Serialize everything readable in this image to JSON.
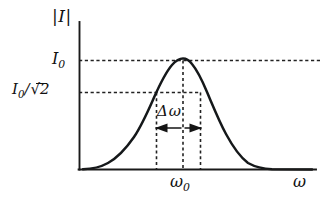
{
  "figure": {
    "background_color": "#ffffff",
    "ink_color": "#111111",
    "labels": {
      "y_axis_title": "|I|",
      "y_tick_peak": "I0",
      "y_tick_peak_parts": {
        "symbol": "I",
        "subscript": "0"
      },
      "y_tick_half_power": "I0/√2",
      "y_tick_half_power_parts": {
        "symbol": "I",
        "subscript": "0",
        "divider": "/",
        "radical": "√",
        "radicand": "2"
      },
      "x_tick_center": "ω0",
      "x_tick_center_parts": {
        "symbol": "ω",
        "subscript": "0"
      },
      "x_axis_title": "ω",
      "width_annotation": "Δω",
      "width_annotation_parts": {
        "delta": "Δ",
        "omega": "ω"
      }
    }
  },
  "chart_data": {
    "type": "line",
    "title": "",
    "subtitle": "",
    "xlabel": "ω",
    "ylabel": "|I|",
    "grid": false,
    "legend": null,
    "axis_style": "open-L (left spine and bottom spine only, arrowless)",
    "curve_description": "Symmetric resonance peak (bell / Lorentzian-like) centred on ω0, rising from zero at both ends of the ω axis",
    "xlim": [
      0,
      1
    ],
    "ylim": [
      0,
      1.12
    ],
    "x_axis_tick_values": [
      0.44
    ],
    "x_axis_tick_labels": [
      "ω0"
    ],
    "y_axis_tick_values": [
      0.707,
      1.0
    ],
    "y_axis_tick_labels": [
      "I0/√2",
      "I0"
    ],
    "peak": {
      "x": 0.44,
      "y": 1.0,
      "label": "I0"
    },
    "half_power_level": {
      "y": 0.707,
      "label": "I0/√2"
    },
    "half_power_points": {
      "x_left": 0.325,
      "x_right": 0.513
    },
    "bandwidth": {
      "label": "Δω",
      "x_left": 0.325,
      "x_right": 0.513,
      "annotation_y": 0.43
    },
    "reference_lines": [
      {
        "orientation": "horizontal",
        "value": 1.0,
        "style": "dashed",
        "label": "I0",
        "extent": "full-width"
      },
      {
        "orientation": "horizontal",
        "value": 0.707,
        "style": "dashed",
        "label": "I0/√2",
        "extent": "left-spine-to-right-half-power-point"
      },
      {
        "orientation": "vertical",
        "value": 0.325,
        "style": "dashed",
        "label": "",
        "extent": "baseline-to-half-power-level"
      },
      {
        "orientation": "vertical",
        "value": 0.44,
        "style": "dashed",
        "label": "ω0",
        "extent": "baseline-to-peak"
      },
      {
        "orientation": "vertical",
        "value": 0.513,
        "style": "dashed",
        "label": "",
        "extent": "baseline-to-half-power-level"
      }
    ],
    "x": [
      0.0,
      0.025,
      0.05,
      0.075,
      0.1,
      0.125,
      0.15,
      0.175,
      0.2,
      0.225,
      0.25,
      0.275,
      0.3,
      0.325,
      0.35,
      0.375,
      0.4,
      0.425,
      0.44,
      0.455,
      0.475,
      0.5,
      0.513,
      0.525,
      0.55,
      0.575,
      0.6,
      0.625,
      0.65,
      0.675,
      0.7,
      0.725,
      0.75,
      0.8,
      0.85,
      0.9,
      0.95,
      1.0
    ],
    "y": [
      0.004,
      0.006,
      0.01,
      0.017,
      0.029,
      0.048,
      0.079,
      0.124,
      0.188,
      0.273,
      0.378,
      0.496,
      0.613,
      0.707,
      0.82,
      0.907,
      0.966,
      0.996,
      1.0,
      0.996,
      0.968,
      0.884,
      0.707,
      0.658,
      0.531,
      0.409,
      0.301,
      0.214,
      0.147,
      0.099,
      0.065,
      0.043,
      0.028,
      0.013,
      0.007,
      0.004,
      0.003,
      0.002
    ]
  }
}
